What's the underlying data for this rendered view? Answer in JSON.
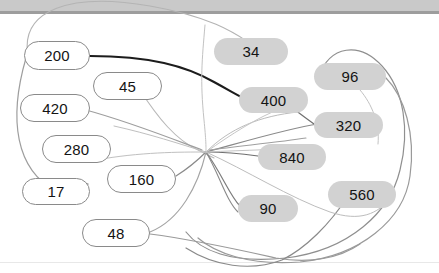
{
  "window": {
    "title": "Number Pill Graph",
    "topbar_color": "#c9c9c9",
    "topbar_edge_color": "#9d9d9d",
    "background_color": "#ffffff"
  },
  "palette": {
    "pill_filled_bg": "#d2d2d2",
    "pill_outline_bg": "#ffffff",
    "pill_outline_border": "#8a8a8a",
    "label_color": "#141414",
    "edge_light": "#9a9a9a",
    "edge_faint": "#c8c8c8",
    "edge_dark": "#1c1c1c"
  },
  "graph": {
    "type": "node-link-diagram",
    "node_count": 14,
    "nodes": [
      {
        "id": "n200",
        "label": "200",
        "style": "outline",
        "x": 24,
        "y": 41,
        "w": 66,
        "h": 29,
        "font_size": 15
      },
      {
        "id": "n34",
        "label": "34",
        "style": "filled",
        "x": 214,
        "y": 38,
        "w": 74,
        "h": 27,
        "font_size": 15
      },
      {
        "id": "n96",
        "label": "96",
        "style": "filled",
        "x": 314,
        "y": 63,
        "w": 72,
        "h": 27,
        "font_size": 15
      },
      {
        "id": "n45",
        "label": "45",
        "style": "outline",
        "x": 93,
        "y": 72,
        "w": 69,
        "h": 28,
        "font_size": 15
      },
      {
        "id": "n400",
        "label": "400",
        "style": "filled",
        "x": 239,
        "y": 87,
        "w": 69,
        "h": 26,
        "font_size": 15
      },
      {
        "id": "n420",
        "label": "420",
        "style": "outline",
        "x": 20,
        "y": 94,
        "w": 70,
        "h": 28,
        "font_size": 15
      },
      {
        "id": "n320",
        "label": "320",
        "style": "filled",
        "x": 314,
        "y": 112,
        "w": 69,
        "h": 26,
        "font_size": 15
      },
      {
        "id": "n280",
        "label": "280",
        "style": "outline",
        "x": 42,
        "y": 135,
        "w": 69,
        "h": 28,
        "font_size": 15
      },
      {
        "id": "n840",
        "label": "840",
        "style": "filled",
        "x": 258,
        "y": 144,
        "w": 68,
        "h": 26,
        "font_size": 15
      },
      {
        "id": "n160",
        "label": "160",
        "style": "outline",
        "x": 107,
        "y": 165,
        "w": 69,
        "h": 28,
        "font_size": 15
      },
      {
        "id": "n560",
        "label": "560",
        "style": "filled",
        "x": 328,
        "y": 181,
        "w": 68,
        "h": 27,
        "font_size": 15
      },
      {
        "id": "n17",
        "label": "17",
        "style": "outline",
        "x": 22,
        "y": 178,
        "w": 68,
        "h": 27,
        "font_size": 15
      },
      {
        "id": "n90",
        "label": "90",
        "style": "filled",
        "x": 238,
        "y": 195,
        "w": 60,
        "h": 27,
        "font_size": 15
      },
      {
        "id": "n48",
        "label": "48",
        "style": "outline",
        "x": 82,
        "y": 219,
        "w": 68,
        "h": 28,
        "font_size": 15
      }
    ],
    "edges": [
      {
        "id": "e1",
        "d": "M 28 56 C 20 10 70 -8 150 6 C 230 20 246 44 262 50",
        "stroke": "#b4b4b4",
        "width": 1.1
      },
      {
        "id": "e2",
        "d": "M 26 58 C 8 120 16 170 56 191",
        "stroke": "#9e9e9e",
        "width": 1.2
      },
      {
        "id": "e3",
        "d": "M 90 56 C 150 56 186 66 214 82 C 236 94 242 98 248 100",
        "stroke": "#1c1c1c",
        "width": 2.1
      },
      {
        "id": "e4",
        "d": "M 205 25 C 202 60 200 80 204 120 C 206 140 206 146 206 152",
        "stroke": "#c2c2c2",
        "width": 1.0
      },
      {
        "id": "e5",
        "d": "M 318 78 C 330 44 360 42 382 66 C 404 90 410 130 400 170 C 390 212 350 250 286 258 C 230 264 200 250 186 232",
        "stroke": "#8f8f8f",
        "width": 1.2
      },
      {
        "id": "e6",
        "d": "M 386 78 C 404 96 416 134 410 176 C 404 220 360 256 300 262 C 248 266 214 252 198 238",
        "stroke": "#9a9a9a",
        "width": 1.2
      },
      {
        "id": "e7",
        "d": "M 140 90 C 158 118 176 140 198 150 C 206 154 210 156 214 158",
        "stroke": "#b8b8b8",
        "width": 1.1
      },
      {
        "id": "e8",
        "d": "M 86 110 C 130 122 170 138 202 150",
        "stroke": "#9e9e9e",
        "width": 1.2
      },
      {
        "id": "e9",
        "d": "M 290 106 C 300 114 306 118 314 124",
        "stroke": "#6f6f6f",
        "width": 1.2
      },
      {
        "id": "e10",
        "d": "M 206 152 C 250 140 290 128 318 124",
        "stroke": "#8a8a8a",
        "width": 1.2
      },
      {
        "id": "e11",
        "d": "M 206 152 C 228 152 244 154 258 156",
        "stroke": "#6f6f6f",
        "width": 1.2
      },
      {
        "id": "e12",
        "d": "M 206 152 C 222 174 230 196 240 206",
        "stroke": "#7c7c7c",
        "width": 1.2
      },
      {
        "id": "e13",
        "d": "M 206 152 C 220 176 226 200 238 212",
        "stroke": "#8a8a8a",
        "width": 1.1
      },
      {
        "id": "e14",
        "d": "M 176 176 C 192 166 200 158 206 152",
        "stroke": "#8a8a8a",
        "width": 1.2
      },
      {
        "id": "e15",
        "d": "M 150 232 C 180 220 198 186 206 152",
        "stroke": "#a4a4a4",
        "width": 1.1
      },
      {
        "id": "e16",
        "d": "M 150 234 C 196 240 240 250 276 258 C 310 264 340 258 360 244",
        "stroke": "#9a9a9a",
        "width": 1.1
      },
      {
        "id": "e17",
        "d": "M 348 196 C 330 224 306 248 282 260 C 250 272 214 266 186 248",
        "stroke": "#8a8a8a",
        "width": 1.2
      },
      {
        "id": "e18",
        "d": "M 206 152 C 246 170 290 198 330 212 C 360 222 378 214 390 198",
        "stroke": "#bdbdbd",
        "width": 1.0
      },
      {
        "id": "e19",
        "d": "M 96 160 C 140 152 180 152 206 152",
        "stroke": "#c0c0c0",
        "width": 1.0
      },
      {
        "id": "e20",
        "d": "M 206 152 C 230 128 260 116 298 112",
        "stroke": "#bcbcbc",
        "width": 1.0
      },
      {
        "id": "e21",
        "d": "M 114 126 C 150 134 180 144 206 152",
        "stroke": "#bfbfbf",
        "width": 1.0
      },
      {
        "id": "e22",
        "d": "M 206 152 C 246 150 282 150 314 146",
        "stroke": "#c4c4c4",
        "width": 1.0
      },
      {
        "id": "e23",
        "d": "M 60 190 C 70 186 78 184 88 184",
        "stroke": "#555555",
        "width": 1.2
      },
      {
        "id": "e24",
        "d": "M 206 152 C 232 134 256 118 282 108",
        "stroke": "#c6c6c6",
        "width": 1.0
      },
      {
        "id": "e25",
        "d": "M 306 138 C 280 142 240 146 210 150",
        "stroke": "#9f9f9f",
        "width": 1.1
      },
      {
        "id": "e26",
        "d": "M 360 90 C 372 104 380 124 378 144",
        "stroke": "#c2c2c2",
        "width": 1.0
      }
    ]
  }
}
